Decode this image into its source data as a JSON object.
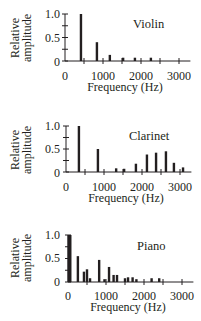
{
  "chart_data": [
    {
      "type": "bar",
      "title": "Violin",
      "xlabel": "Frequency (Hz)",
      "ylabel": "Relative amplitude",
      "xlim": [
        0,
        3300
      ],
      "ylim": [
        0,
        1.0
      ],
      "xticks": [
        0,
        500,
        1000,
        1500,
        2000,
        2500,
        3000
      ],
      "xtick_labels": [
        "0",
        "1000",
        "2000",
        "3000"
      ],
      "ytick_labels": [
        "1.0",
        "0.5",
        "0"
      ],
      "grid": false,
      "x": [
        420,
        840,
        1180,
        1530,
        1840,
        2260
      ],
      "values": [
        1.0,
        0.4,
        0.13,
        0.07,
        0.07,
        0.07
      ]
    },
    {
      "type": "bar",
      "title": "Clarinet",
      "xlabel": "Frequency (Hz)",
      "ylabel": "Relative amplitude",
      "xlim": [
        0,
        3300
      ],
      "ylim": [
        0,
        1.0
      ],
      "xticks": [
        0,
        500,
        1000,
        1500,
        2000,
        2500,
        3000
      ],
      "xtick_labels": [
        "0",
        "1000",
        "2000",
        "3000"
      ],
      "ytick_labels": [
        "1.0",
        "0.5",
        "0"
      ],
      "grid": false,
      "x": [
        340,
        840,
        1320,
        1530,
        1840,
        2130,
        2370,
        2630,
        2840,
        3080
      ],
      "values": [
        1.0,
        0.5,
        0.08,
        0.07,
        0.18,
        0.38,
        0.42,
        0.45,
        0.2,
        0.1
      ]
    },
    {
      "type": "bar",
      "title": "Piano",
      "xlabel": "Frequency (Hz)",
      "ylabel": "Relative amplitude",
      "xlim": [
        0,
        3300
      ],
      "ylim": [
        0,
        1.0
      ],
      "xticks": [
        0,
        500,
        1000,
        1500,
        2000,
        2500,
        3000
      ],
      "xtick_labels": [
        "0",
        "1000",
        "2000",
        "3000"
      ],
      "ytick_labels": [
        "1.0",
        "0.5",
        "0"
      ],
      "grid": false,
      "x": [
        20,
        60,
        260,
        420,
        500,
        580,
        820,
        960,
        1080,
        1200,
        1290,
        1500,
        1580,
        1700,
        1800,
        2200,
        2400
      ],
      "values": [
        1.0,
        1.0,
        0.55,
        0.22,
        0.27,
        0.08,
        0.47,
        0.06,
        0.32,
        0.15,
        0.15,
        0.08,
        0.1,
        0.1,
        0.06,
        0.08,
        0.08
      ]
    }
  ],
  "panels": [
    {
      "name": "Violin",
      "ylabel_line1": "Relative",
      "ylabel_line2": "amplitude",
      "xlabel": "Frequency (Hz)",
      "yticks": [
        "1.0",
        "0.5",
        "0"
      ],
      "xticks": [
        "0",
        "1000",
        "2000",
        "3000"
      ]
    },
    {
      "name": "Clarinet",
      "ylabel_line1": "Relative",
      "ylabel_line2": "amplitude",
      "xlabel": "Frequency (Hz)",
      "yticks": [
        "1.0",
        "0.5",
        "0"
      ],
      "xticks": [
        "0",
        "1000",
        "2000",
        "3000"
      ]
    },
    {
      "name": "Piano",
      "ylabel_line1": "Relative",
      "ylabel_line2": "amplitude",
      "xlabel": "Frequency (Hz)",
      "yticks": [
        "1.0",
        "0.5",
        "0"
      ],
      "xticks": [
        "0",
        "1000",
        "2000",
        "3000"
      ]
    }
  ]
}
